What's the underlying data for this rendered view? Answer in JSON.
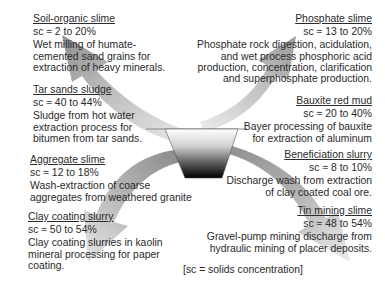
{
  "diagram": {
    "center": {
      "label": "basin",
      "colors": {
        "top": "#ffffff",
        "bottom": "#000000"
      }
    },
    "items": [
      {
        "title": "Soil-organic slime",
        "sc": "sc ≈ 2 to 20%",
        "desc_lines": [
          "Wet milling of humate-",
          "cemented sand grains for",
          "extraction of heavy minerals."
        ]
      },
      {
        "title": "Tar sands sludge",
        "sc": "sc ≈ 40 to 44%",
        "desc_lines": [
          "Sludge from hot water",
          "extraction process for",
          "bitumen from tar sands."
        ]
      },
      {
        "title": "Aggregate slime",
        "sc": "sc ≈ 12 to 18%",
        "desc_lines": [
          "Wash-extraction of coarse",
          "aggregates from weathered granite"
        ]
      },
      {
        "title": "Clay coating slurry",
        "sc": "sc ≈ 50 to 54%",
        "desc_lines": [
          "Clay coating slurries in kaolin",
          "mineral processing for paper",
          "coating."
        ]
      },
      {
        "title": "Phosphate slime",
        "sc": "sc ≈ 13 to 20%",
        "desc_lines": [
          "Phosphate rock digestion, acidulation,",
          "and wet process phosphoric acid",
          "production, concentration, clarification",
          "and superphosphate production."
        ]
      },
      {
        "title": "Bauxite red mud",
        "sc": "sc ≈ 20 to 40%",
        "desc_lines": [
          "Bayer processing of bauxite",
          "for extraction of aluminum"
        ]
      },
      {
        "title": "Beneficiation slurry",
        "sc": "sc ≈ 8 to 10%",
        "desc_lines": [
          "Discharge wash from extraction",
          "of clay coated coal ore."
        ]
      },
      {
        "title": "Tin mining slime",
        "sc": "sc ≈ 48 to 54%",
        "desc_lines": [
          "Gravel-pump mining discharge from",
          "hydraulic mining of  placer  deposits."
        ]
      }
    ],
    "legend": "[sc = solids concentration]"
  }
}
